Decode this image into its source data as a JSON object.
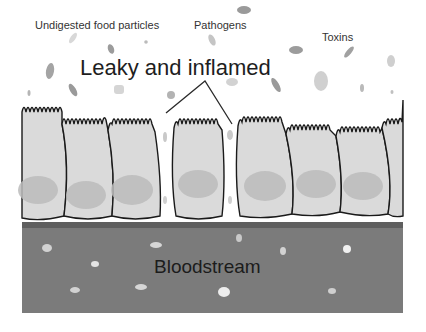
{
  "labels": {
    "food_particles": "Undigested food particles",
    "pathogens": "Pathogens",
    "toxins": "Toxins",
    "headline": "Leaky and inflamed",
    "bloodstream": "Bloodstream"
  },
  "colors": {
    "background": "#ffffff",
    "cell_fill": "#d9d9d9",
    "nucleus_fill": "#bdbdbd",
    "cell_outline": "#1a1a1a",
    "bloodstream_fill": "#7a7a7a",
    "bloodstream_top_band": "#5e5e5e",
    "particle_gray": "#9a9a9a",
    "particle_light": "#c8c8c8",
    "blood_particle": "#e6e6e6"
  },
  "icons": {
    "particle": "blob-shape",
    "cell": "epithelial-cell-shape"
  }
}
